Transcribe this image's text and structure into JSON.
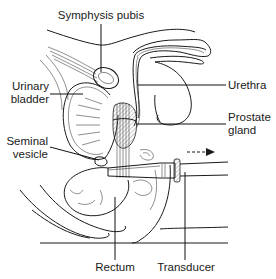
{
  "figure": {
    "labels": {
      "symphysis_pubis": "Symphysis pubis",
      "urinary_bladder_line1": "Urinary",
      "urinary_bladder_line2": "bladder",
      "urethra": "Urethra",
      "prostate_gland_line1": "Prostate",
      "prostate_gland_line2": "gland",
      "seminal_vesicle_line1": "Seminal",
      "seminal_vesicle_line2": "vesicle",
      "rectum": "Rectum",
      "transducer": "Transducer"
    },
    "arrow": {
      "style": "dashed",
      "direction": "right"
    },
    "colors": {
      "ink": "#1a1a1a",
      "background": "#ffffff",
      "hatch": "#888888"
    }
  }
}
